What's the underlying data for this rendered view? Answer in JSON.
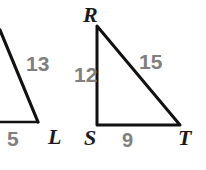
{
  "figure": {
    "stroke_color": "#111111",
    "label_color": "#808080",
    "vertex_color": "#1a1a1a",
    "background": "#ffffff",
    "triangles": [
      {
        "name": "left-triangle-cropped",
        "cropped": true,
        "vertices": [
          {
            "label": "",
            "x": 0,
            "y": 30
          },
          {
            "label": "",
            "x": 0,
            "y": 122
          },
          {
            "label": "L",
            "x": 38,
            "y": 122
          }
        ],
        "side_labels": [
          {
            "text": "13",
            "side": "hypotenuse"
          },
          {
            "text": "5",
            "side": "base"
          }
        ]
      },
      {
        "name": "right-triangle-RST",
        "cropped": false,
        "vertices": [
          {
            "label": "R",
            "x": 97,
            "y": 26
          },
          {
            "label": "S",
            "x": 97,
            "y": 125
          },
          {
            "label": "T",
            "x": 180,
            "y": 125
          }
        ],
        "side_labels": [
          {
            "text": "12",
            "side": "RS-vertical-leg"
          },
          {
            "text": "15",
            "side": "RT-hypotenuse"
          },
          {
            "text": "9",
            "side": "ST-base"
          }
        ]
      }
    ]
  },
  "labels": {
    "thirteen": "13",
    "five": "5",
    "vertex_L": "L",
    "vertex_R": "R",
    "twelve": "12",
    "fifteen": "15",
    "vertex_S": "S",
    "nine": "9",
    "vertex_T": "T"
  }
}
